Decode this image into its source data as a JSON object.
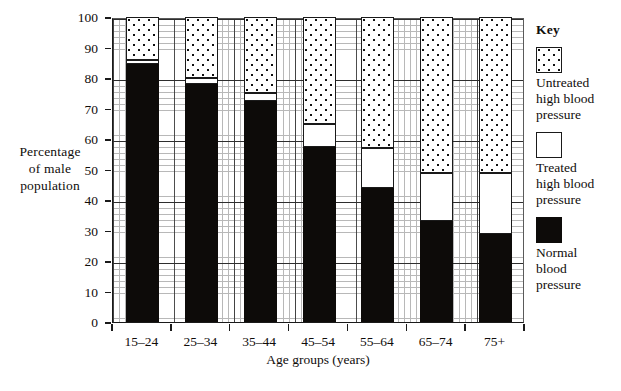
{
  "chart_data": {
    "type": "bar",
    "subtype": "stacked-bar",
    "title": "",
    "xlabel": "Age groups (years)",
    "ylabel": "Percentage of male population",
    "categories": [
      "15–24",
      "25–34",
      "35–44",
      "45–54",
      "55–64",
      "65–74",
      "75+"
    ],
    "series": [
      {
        "name": "Normal blood pressure",
        "values": [
          84.5,
          78,
          72.5,
          57.5,
          44,
          33,
          29
        ],
        "color": "#0d0b09"
      },
      {
        "name": "Treated high blood pressure",
        "values": [
          1.5,
          2,
          2.5,
          7.5,
          13,
          16,
          20
        ],
        "color": "#ffffff"
      },
      {
        "name": "Untreated high blood pressure",
        "values": [
          14,
          20,
          25,
          35,
          43,
          51,
          51
        ],
        "color": "#ffffff-dotted"
      }
    ],
    "cumulative_tops": [
      {
        "category": "15–24",
        "normal_top": 84.5,
        "treated_top": 86,
        "untreated_top": 100
      },
      {
        "category": "25–34",
        "normal_top": 78,
        "treated_top": 80,
        "untreated_top": 100
      },
      {
        "category": "35–44",
        "normal_top": 72.5,
        "treated_top": 75,
        "untreated_top": 100
      },
      {
        "category": "45–54",
        "normal_top": 57.5,
        "treated_top": 65,
        "untreated_top": 100
      },
      {
        "category": "55–64",
        "normal_top": 44,
        "treated_top": 57,
        "untreated_top": 100
      },
      {
        "category": "65–74",
        "normal_top": 33,
        "treated_top": 49,
        "untreated_top": 100
      },
      {
        "category": "75+",
        "normal_top": 29,
        "treated_top": 49,
        "untreated_top": 100
      }
    ],
    "ylim": [
      0,
      100
    ],
    "yticks": [
      0,
      10,
      20,
      30,
      40,
      50,
      60,
      70,
      80,
      90,
      100
    ],
    "ytick_labels": [
      "0",
      "10",
      "20",
      "30",
      "40",
      "50",
      "60",
      "70",
      "80",
      "90",
      "100"
    ],
    "grid": "major and minor, both axes",
    "minor_grid_step": 2,
    "legend_position": "right"
  },
  "axes": {
    "y_title_lines": [
      "Percentage",
      "of male",
      "population"
    ],
    "x_title": "Age groups (years)"
  },
  "key": {
    "title": "Key",
    "items": [
      {
        "swatch": "untreated",
        "lines": [
          "Untreated",
          "high blood",
          "pressure"
        ]
      },
      {
        "swatch": "treated",
        "lines": [
          "Treated",
          "high blood",
          "pressure"
        ]
      },
      {
        "swatch": "normal",
        "lines": [
          "Normal",
          "blood",
          "pressure"
        ]
      }
    ]
  }
}
